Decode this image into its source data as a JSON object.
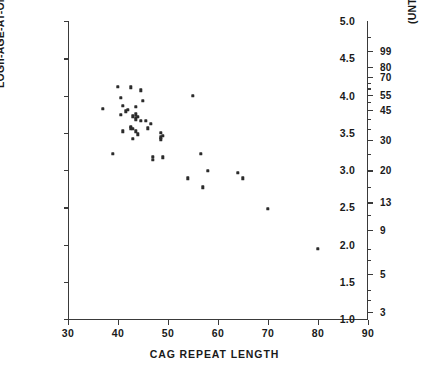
{
  "chart_data": {
    "type": "scatter",
    "title": "",
    "xlabel": "CAG  REPEAT  LENGTH",
    "ylabel": "LOGn-AGE-AT-ONSET OF HD",
    "ylabel_right": "(UNTRANSFORMED) AGE AT ONSET OF HD",
    "xlim": [
      30,
      90
    ],
    "ylim": [
      1.0,
      5.0
    ],
    "grid": false,
    "legend": null,
    "xticks": [
      30,
      40,
      50,
      60,
      70,
      80,
      90
    ],
    "xtick_labels": [
      "30",
      "40",
      "50",
      "60",
      "70",
      "80",
      "90"
    ],
    "yticks": [
      1.0,
      1.5,
      2.0,
      2.5,
      3.0,
      3.5,
      4.0,
      4.5,
      5.0
    ],
    "ytick_labels": [
      "1.0",
      "1.5",
      "2.0",
      "2.5",
      "3.0",
      "3.5",
      "4.0",
      "4.5",
      "5.0"
    ],
    "right_axis": {
      "scale": "log",
      "tick_values": [
        99,
        80,
        70,
        55,
        45,
        30,
        20,
        13,
        9,
        5,
        3
      ],
      "tick_labels": [
        "99",
        "80",
        "70",
        "55",
        "45",
        "30",
        "20",
        "13",
        "9",
        "5",
        "3"
      ],
      "minor_tick_values": [
        150,
        120,
        65,
        60,
        50,
        40,
        35,
        25,
        16,
        11,
        7,
        6,
        4,
        3.5
      ]
    },
    "marker": "square",
    "marker_color": "#2b2b2b",
    "series": [
      {
        "name": "HD patients",
        "points": [
          [
            37.0,
            3.82
          ],
          [
            39.0,
            3.22
          ],
          [
            40.0,
            4.12
          ],
          [
            40.5,
            3.97
          ],
          [
            40.5,
            3.74
          ],
          [
            41.0,
            3.86
          ],
          [
            41.0,
            3.52
          ],
          [
            41.5,
            3.79
          ],
          [
            42.0,
            3.81
          ],
          [
            42.5,
            4.11
          ],
          [
            42.5,
            3.58
          ],
          [
            42.5,
            3.56
          ],
          [
            43.0,
            3.72
          ],
          [
            43.0,
            3.55
          ],
          [
            43.0,
            3.42
          ],
          [
            43.5,
            3.85
          ],
          [
            43.5,
            3.75
          ],
          [
            43.5,
            3.7
          ],
          [
            43.5,
            3.67
          ],
          [
            43.5,
            3.52
          ],
          [
            44.0,
            3.71
          ],
          [
            44.0,
            3.48
          ],
          [
            44.5,
            4.07
          ],
          [
            44.5,
            3.66
          ],
          [
            45.0,
            3.93
          ],
          [
            45.5,
            3.66
          ],
          [
            46.0,
            3.56
          ],
          [
            46.5,
            3.62
          ],
          [
            47.0,
            3.18
          ],
          [
            47.0,
            3.14
          ],
          [
            48.5,
            3.5
          ],
          [
            48.5,
            3.44
          ],
          [
            48.5,
            3.41
          ],
          [
            49.0,
            3.46
          ],
          [
            49.0,
            3.17
          ],
          [
            54.0,
            2.89
          ],
          [
            55.0,
            4.0
          ],
          [
            56.5,
            3.22
          ],
          [
            57.0,
            2.77
          ],
          [
            58.0,
            2.99
          ],
          [
            64.0,
            2.96
          ],
          [
            65.0,
            2.89
          ],
          [
            70.0,
            2.48
          ],
          [
            80.0,
            1.94
          ]
        ]
      }
    ]
  },
  "axes": {
    "left_title": "LOGn-AGE-AT-ONSET OF HD",
    "right_title": "(UNTRANSFORMED) AGE AT ONSET OF HD",
    "bottom_title": "CAG  REPEAT  LENGTH"
  }
}
